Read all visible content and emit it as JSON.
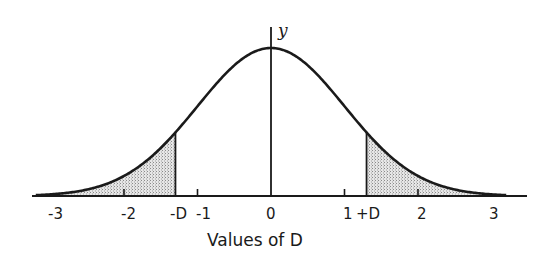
{
  "figure": {
    "y_axis_label": "y",
    "x_axis_title": "Values of D",
    "colors": {
      "ink": "#1a1a1a",
      "shade": "#cfcfcf",
      "background": "#ffffff"
    }
  },
  "chart_data": {
    "type": "area",
    "title": "",
    "xlabel": "Values of D",
    "ylabel": "y",
    "xlim": [
      -3.2,
      3.2
    ],
    "ticks": [
      {
        "value": -3,
        "label": "-3"
      },
      {
        "value": -2,
        "label": "-2"
      },
      {
        "value": -1,
        "label": "-1"
      },
      {
        "value": 0,
        "label": "0"
      },
      {
        "value": 1,
        "label": "1"
      },
      {
        "value": 2,
        "label": "2"
      },
      {
        "value": 3,
        "label": "3"
      }
    ],
    "markers": [
      {
        "value": -1.3,
        "label": "-D"
      },
      {
        "value": 1.3,
        "label": "+D"
      }
    ],
    "shaded_regions": [
      {
        "from": -3.2,
        "to": -1.3,
        "label": "left tail"
      },
      {
        "from": 1.3,
        "to": 3.2,
        "label": "right tail"
      }
    ],
    "curve": "normal(0,1)",
    "grid": false,
    "legend": null
  }
}
